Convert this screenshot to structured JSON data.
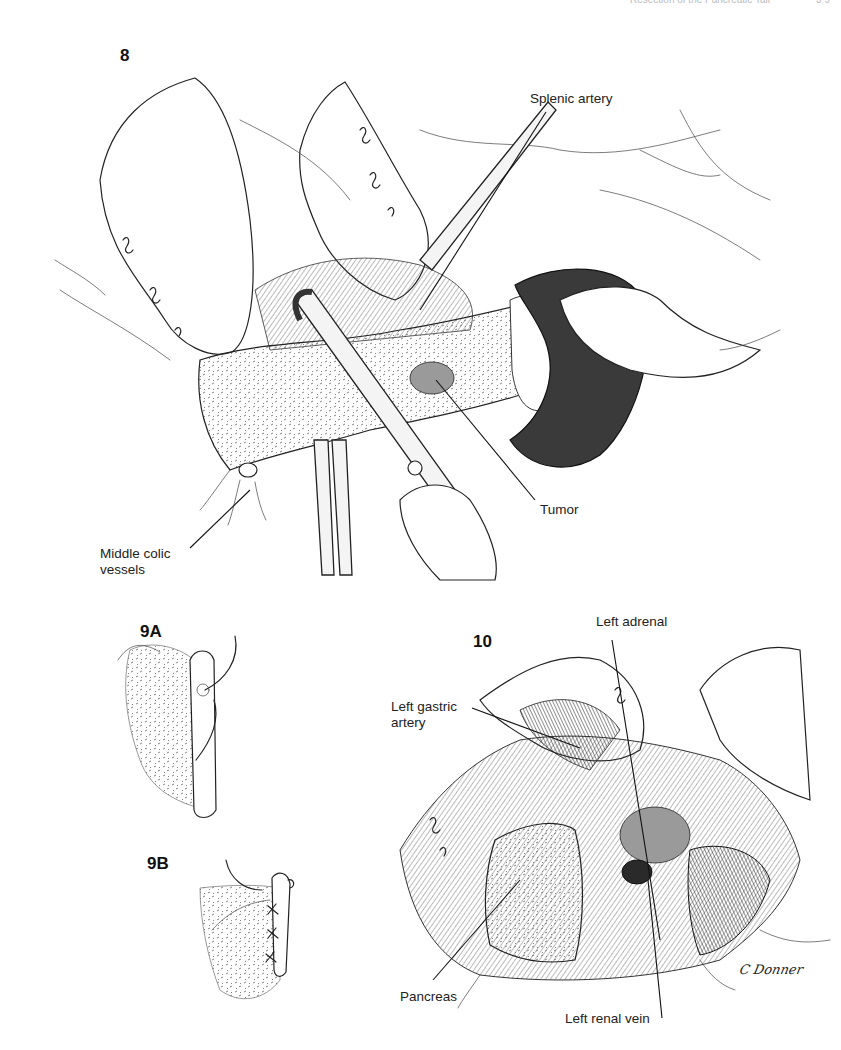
{
  "page_header": {
    "running_title": "Resection of the Pancreatic Tail",
    "page_number": "3 9"
  },
  "figures": [
    {
      "id": "fig-8",
      "number": "8",
      "labels": [
        {
          "key": "splenic_artery",
          "text": "Splenic artery"
        },
        {
          "key": "tumor",
          "text": "Tumor"
        },
        {
          "key": "middle_colic_vessels",
          "text": "Middle colic\nvessels"
        }
      ]
    },
    {
      "id": "fig-9a",
      "number": "9A",
      "labels": []
    },
    {
      "id": "fig-9b",
      "number": "9B",
      "labels": []
    },
    {
      "id": "fig-10",
      "number": "10",
      "labels": [
        {
          "key": "left_adrenal",
          "text": "Left adrenal"
        },
        {
          "key": "left_gastric_artery",
          "text": "Left gastric\nartery"
        },
        {
          "key": "pancreas",
          "text": "Pancreas"
        },
        {
          "key": "left_renal_vein",
          "text": "Left renal vein"
        }
      ]
    }
  ],
  "signature": "C Donner",
  "colors": {
    "ink": "#1a1a1a",
    "background": "#ffffff",
    "shading": "#9a9a9a"
  }
}
